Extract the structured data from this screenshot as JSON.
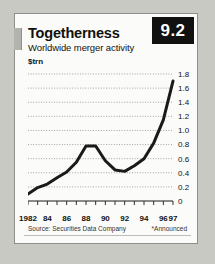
{
  "card": {
    "badge": "9.2",
    "title": "Togetherness",
    "subtitle": "Worldwide merger activity",
    "unit": "$trn",
    "source": "Source: Securities Data Company",
    "note": "*Announced"
  },
  "colors": {
    "badge_bg": "#111111",
    "badge_text": "#ffffff",
    "line": "#1a1a1a",
    "grid": "#9a9a96",
    "card_bg": "#fbfbf9",
    "card_border": "#8e8e8a",
    "page_bg": "#c9c9c4"
  },
  "chart_data": {
    "type": "line",
    "title": "Togetherness",
    "subtitle": "Worldwide merger activity",
    "xlabel": "",
    "ylabel": "$trn",
    "ylim": [
      0,
      1.8
    ],
    "xlim": [
      1982,
      1997
    ],
    "grid": true,
    "legend": null,
    "yticks": [
      0,
      0.2,
      0.4,
      0.6,
      0.8,
      1.0,
      1.2,
      1.4,
      1.6,
      1.8
    ],
    "ytick_labels": [
      "0",
      "0.2",
      "0.4",
      "0.6",
      "0.8",
      "1.0",
      "1.2",
      "1.4",
      "1.6",
      "1.8"
    ],
    "xticks": [
      1982,
      1983,
      1984,
      1985,
      1986,
      1987,
      1988,
      1989,
      1990,
      1991,
      1992,
      1993,
      1994,
      1995,
      1996,
      1997
    ],
    "xtick_labels": [
      "1982",
      "84",
      "86",
      "88",
      "90",
      "92",
      "94",
      "96",
      "97"
    ],
    "xtick_label_years": [
      1982,
      1984,
      1986,
      1988,
      1990,
      1992,
      1994,
      1996,
      1997
    ],
    "x": [
      1982,
      1983,
      1984,
      1985,
      1986,
      1987,
      1988,
      1989,
      1990,
      1991,
      1992,
      1993,
      1994,
      1995,
      1996,
      1997
    ],
    "values": [
      0.1,
      0.19,
      0.24,
      0.33,
      0.41,
      0.55,
      0.78,
      0.78,
      0.57,
      0.44,
      0.42,
      0.5,
      0.6,
      0.82,
      1.15,
      1.7
    ],
    "annotations": [
      "*Announced"
    ]
  }
}
